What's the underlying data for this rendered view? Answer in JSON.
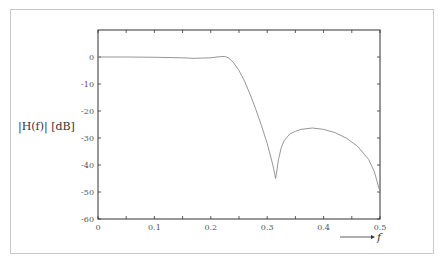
{
  "chart_data": {
    "type": "line",
    "title": "",
    "xlabel": "f",
    "ylabel": "|H(f)| [dB]",
    "xlim": [
      0,
      0.5
    ],
    "ylim": [
      -60,
      10
    ],
    "grid": false,
    "legend": null,
    "x_ticks": [
      0,
      0.05,
      0.1,
      0.15,
      0.2,
      0.25,
      0.3,
      0.35,
      0.4,
      0.45,
      0.5
    ],
    "x_tick_labels": [
      "0",
      "0.1",
      "0.2",
      "0.3",
      "0.4",
      "0.5"
    ],
    "x_tick_label_values": [
      0,
      0.1,
      0.2,
      0.3,
      0.4,
      0.5
    ],
    "y_ticks": [
      0,
      -10,
      -20,
      -30,
      -40,
      -50,
      -60
    ],
    "y_tick_labels": [
      "0",
      "-10",
      "-20",
      "-30",
      "-40",
      "-50",
      "-60"
    ],
    "series": [
      {
        "name": "|H(f)|",
        "color": "#8a8a8a",
        "x": [
          0,
          0.05,
          0.1,
          0.15,
          0.17,
          0.2,
          0.215,
          0.225,
          0.232,
          0.24,
          0.25,
          0.26,
          0.27,
          0.28,
          0.29,
          0.3,
          0.31,
          0.315,
          0.32,
          0.325,
          0.33,
          0.34,
          0.35,
          0.36,
          0.38,
          0.4,
          0.42,
          0.44,
          0.46,
          0.48,
          0.49,
          0.5
        ],
        "values": [
          0,
          0,
          -0.1,
          -0.3,
          -0.5,
          -0.3,
          0.1,
          0.2,
          -0.4,
          -2,
          -5,
          -9,
          -14,
          -19.5,
          -25.5,
          -32,
          -40,
          -45,
          -38,
          -33.5,
          -31,
          -28.5,
          -27.5,
          -26.8,
          -26.3,
          -26.8,
          -28,
          -30,
          -33,
          -38,
          -42.5,
          -50
        ]
      }
    ],
    "annotations": [
      {
        "text": "f",
        "type": "arrow-label",
        "position": "below-right of x-axis"
      }
    ]
  }
}
